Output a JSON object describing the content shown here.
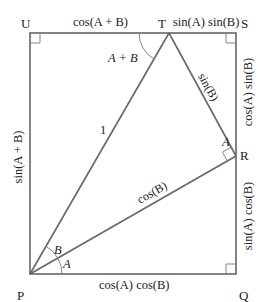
{
  "diagram": {
    "points": {
      "P": {
        "label": "P",
        "x": 30,
        "y": 274
      },
      "Q": {
        "label": "Q",
        "x": 236,
        "y": 274
      },
      "S": {
        "label": "S",
        "x": 236,
        "y": 33
      },
      "U": {
        "label": "U",
        "x": 30,
        "y": 33
      },
      "T": {
        "label": "T",
        "x": 169,
        "y": 33
      },
      "R": {
        "label": "R",
        "x": 236,
        "y": 156
      }
    },
    "segment_labels": {
      "UT": "cos(A + B)",
      "TS": "sin(A) sin(B)",
      "SR": "cos(A) sin(B)",
      "RQ": "sin(A) cos(B)",
      "PQ": "cos(A) cos(B)",
      "UP": "sin(A + B)",
      "PT": "1",
      "TR": "sin(B)",
      "PR": "cos(B)"
    },
    "angle_labels": {
      "at_T": "A + B",
      "at_R": "A",
      "at_P_upper": "B",
      "at_P_lower": "A"
    },
    "right_angles": [
      "U",
      "S",
      "Q",
      "R"
    ],
    "colors": {
      "stroke": "#666666",
      "text": "#222222",
      "background": "#ffffff"
    }
  }
}
